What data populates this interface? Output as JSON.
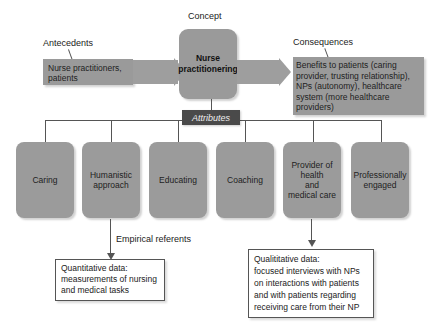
{
  "diagram": {
    "concept": {
      "caption": "Concept",
      "title_line1": "Nurse",
      "title_line2": "practitionering"
    },
    "antecedents": {
      "caption": "Antecedents",
      "line1": "Nurse practitioners,",
      "line2": "patients"
    },
    "consequences": {
      "caption": "Consequences",
      "lines": [
        "Benefits to patients (caring",
        "provider, trusting relationship),",
        "NPs (autonomy), healthcare",
        "system (more healthcare",
        "providers)"
      ]
    },
    "attributes": {
      "header": "Attributes",
      "items": [
        {
          "lines": [
            "Caring"
          ]
        },
        {
          "lines": [
            "Humanistic",
            "approach"
          ]
        },
        {
          "lines": [
            "Educating"
          ]
        },
        {
          "lines": [
            "Coaching"
          ]
        },
        {
          "lines": [
            "Provider of",
            "health",
            "and",
            "medical care"
          ]
        },
        {
          "lines": [
            "Professionally",
            "engaged"
          ]
        }
      ]
    },
    "empirical_referents": {
      "caption": "Empirical referents",
      "quantitative": {
        "lines": [
          "Quantitative data:",
          "measurements of nursing",
          "and medical tasks"
        ]
      },
      "qualitative": {
        "lines": [
          "Qualititative data:",
          "focused interviews with NPs",
          "on interactions with patients",
          "and with patients regarding",
          "receiving care from their NP"
        ]
      }
    },
    "colors": {
      "box_gray": "#9a9a9a",
      "attributes_header": "#4a4a4a",
      "line": "#555555"
    }
  }
}
